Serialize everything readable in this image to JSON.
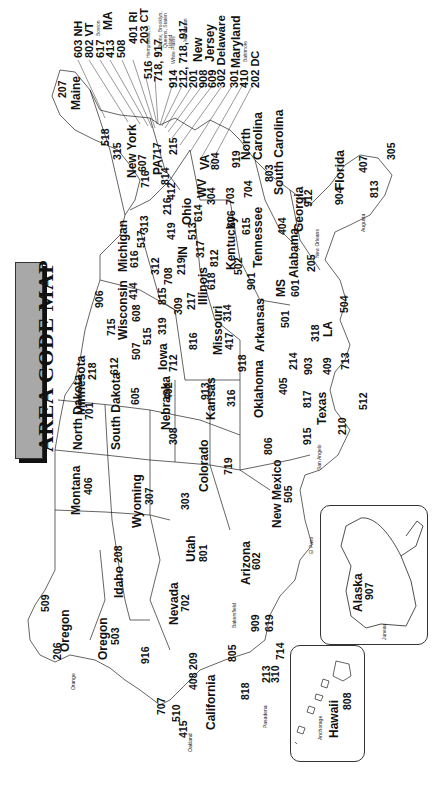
{
  "title": "AREA CODE MAP",
  "orientation": "rotated 90 degrees counterclockwise",
  "states": [
    {
      "name": "Maine",
      "codes": [
        "207"
      ]
    },
    {
      "name": "New York",
      "codes": [
        "518",
        "315",
        "607",
        "716"
      ]
    },
    {
      "name": "PA",
      "codes": [
        "717",
        "814",
        "412",
        "215"
      ]
    },
    {
      "name": "WV",
      "codes": [
        "304"
      ]
    },
    {
      "name": "VA",
      "codes": [
        "804",
        "703"
      ]
    },
    {
      "name": "North Carolina",
      "codes": [
        "919",
        "704"
      ]
    },
    {
      "name": "South Carolina",
      "codes": [
        "803"
      ]
    },
    {
      "name": "Georgia",
      "codes": [
        "404",
        "912"
      ]
    },
    {
      "name": "Florida",
      "codes": [
        "904",
        "407",
        "813",
        "305"
      ]
    },
    {
      "name": "Alabama",
      "codes": [
        "205"
      ]
    },
    {
      "name": "MS",
      "codes": [
        "601"
      ]
    },
    {
      "name": "LA",
      "codes": [
        "504",
        "318"
      ]
    },
    {
      "name": "Tennessee",
      "codes": [
        "615",
        "901"
      ]
    },
    {
      "name": "Kentucky",
      "codes": [
        "606",
        "502"
      ]
    },
    {
      "name": "Ohio",
      "codes": [
        "216",
        "614",
        "419",
        "513"
      ]
    },
    {
      "name": "IN",
      "codes": [
        "219",
        "317",
        "812"
      ]
    },
    {
      "name": "Michigan",
      "codes": [
        "616",
        "517",
        "313",
        "906"
      ]
    },
    {
      "name": "Illinois",
      "codes": [
        "312",
        "708",
        "815",
        "309",
        "217",
        "618"
      ]
    },
    {
      "name": "Wisconsin",
      "codes": [
        "715",
        "414",
        "608"
      ]
    },
    {
      "name": "Minnesota",
      "codes": [
        "218",
        "612",
        "507"
      ]
    },
    {
      "name": "Iowa",
      "codes": [
        "319",
        "515",
        "712"
      ]
    },
    {
      "name": "Missouri",
      "codes": [
        "314",
        "816",
        "417"
      ]
    },
    {
      "name": "Arkansas",
      "codes": [
        "501"
      ]
    },
    {
      "name": "Texas",
      "codes": [
        "214",
        "903",
        "409",
        "713",
        "817",
        "512",
        "915",
        "210",
        "806"
      ]
    },
    {
      "name": "Oklahoma",
      "codes": [
        "918",
        "405"
      ]
    },
    {
      "name": "Kansas",
      "codes": [
        "913",
        "316"
      ]
    },
    {
      "name": "Nebraska",
      "codes": [
        "402",
        "308"
      ]
    },
    {
      "name": "South Dakota",
      "codes": [
        "605"
      ]
    },
    {
      "name": "North Dakota",
      "codes": [
        "701"
      ]
    },
    {
      "name": "Montana",
      "codes": [
        "406"
      ]
    },
    {
      "name": "Wyoming",
      "codes": [
        "307"
      ]
    },
    {
      "name": "Colorado",
      "codes": [
        "303",
        "719"
      ]
    },
    {
      "name": "New Mexico",
      "codes": [
        "505"
      ]
    },
    {
      "name": "Arizona",
      "codes": [
        "602"
      ]
    },
    {
      "name": "Utah",
      "codes": [
        "801"
      ]
    },
    {
      "name": "Idaho",
      "codes": [
        "208"
      ]
    },
    {
      "name": "Washington",
      "codes": [
        "509",
        "206"
      ]
    },
    {
      "name": "Oregon",
      "codes": [
        "503"
      ]
    },
    {
      "name": "Nevada",
      "codes": [
        "702"
      ]
    },
    {
      "name": "California",
      "codes": [
        "916",
        "209",
        "707",
        "510",
        "415",
        "408",
        "805",
        "818",
        "213",
        "310",
        "909",
        "619",
        "714"
      ]
    },
    {
      "name": "Alaska",
      "codes": [
        "907"
      ]
    },
    {
      "name": "Hawaii",
      "codes": [
        "808"
      ]
    }
  ],
  "callouts": {
    "nh": "603 NH",
    "vt": "802 VT",
    "ma_codes": [
      "617",
      "413",
      "508"
    ],
    "ma_label": "MA",
    "boston": "Boston",
    "ri": "401 RI",
    "ct": "203 CT",
    "li": "516",
    "li_city": "Hempstead, LI",
    "nyc_outer": "718, 917",
    "nyc_outer_city": "Bronx, Brooklyn, Queens, Staten Island",
    "westchester": "914",
    "westchester_city": "White Plains",
    "manhattan": "212, 718, 917",
    "manhattan_city": "Manhattan",
    "nj_codes": [
      "201",
      "908",
      "609"
    ],
    "nj_label": "New Jersey",
    "de": "302 Delaware",
    "md_codes": [
      "301",
      "410"
    ],
    "md_label": "Maryland",
    "baltimore": "Baltimore",
    "dc": "202 DC"
  },
  "cities": [
    "Bangor",
    "Concord",
    "Albany",
    "Syracuse",
    "Buffalo",
    "Philadelphia",
    "Harrisburg",
    "Pittsburgh",
    "Cleveland",
    "Columbus",
    "Toledo",
    "Cincinnati",
    "Detroit",
    "Grand Rapids",
    "South Bend",
    "Indianapolis",
    "Frankfort",
    "Louisville",
    "Nashville",
    "Memphis",
    "Knoxville",
    "Charleston",
    "Richmond",
    "Roanoke",
    "Raleigh",
    "Wilmington",
    "Charlotte",
    "Columbia",
    "Charleston",
    "Savannah",
    "Atlanta",
    "Augusta",
    "Tallahassee",
    "St. Petersburg",
    "Tampa",
    "Miami",
    "Birmingham",
    "Montgomery",
    "Mobile",
    "New Orleans",
    "Baton Rouge",
    "Jackson",
    "Meridian",
    "Shreveport",
    "Little Rock",
    "St. Louis",
    "Springfield",
    "Kansas City",
    "Chicago",
    "Peoria",
    "Rockford",
    "Milwaukee",
    "Madison",
    "Duluth",
    "Minneapolis",
    "St. Paul",
    "Des Moines",
    "Dubuque",
    "Sioux City",
    "Omaha",
    "Lincoln",
    "North Platte",
    "Topeka",
    "Wichita",
    "Tulsa",
    "Oklahoma City",
    "Wichita Falls",
    "Amarillo",
    "Dallas",
    "Ft. Worth",
    "Houston",
    "Beaumont",
    "San Antonio",
    "Corpus Christi",
    "San Angelo",
    "El Paso",
    "Las Cruces",
    "Santa Fe",
    "Albuquerque",
    "Denver",
    "Pueblo",
    "Grand Junction",
    "Cheyenne",
    "Sheridan",
    "Billings",
    "Helena",
    "Butte",
    "Boise",
    "Idaho Falls",
    "Salt Lake City",
    "Phoenix",
    "Tucson",
    "Las Vegas",
    "Reno",
    "Sacramento",
    "Santa Rosa",
    "Oakland",
    "San Francisco",
    "San Jose",
    "Fresno",
    "Bakersfield",
    "Santa Barbara",
    "Pasadena",
    "Los Angeles",
    "Orange",
    "San Diego",
    "Portland",
    "Salem",
    "Eugene",
    "Seattle",
    "Tacoma",
    "Spokane",
    "Bismarck",
    "Fargo",
    "Pierre",
    "Sioux Falls",
    "Juneau",
    "Anchorage",
    "Honolulu"
  ]
}
